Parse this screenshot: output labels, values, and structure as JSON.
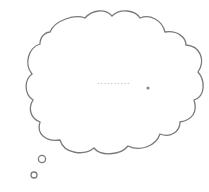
{
  "thought_bubble": {
    "text": "..........",
    "outline_color": "#7a7a7a",
    "fill_color": "#ffffff",
    "dot_color": "#8a8a8a"
  }
}
